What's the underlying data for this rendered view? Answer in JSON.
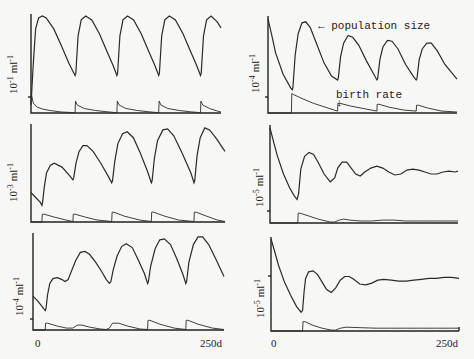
{
  "chart_data": [
    {
      "panel": "top-left",
      "type": "line",
      "ylabel": "10^-1 ml^-1",
      "ylabel_base": "10",
      "ylabel_exp": "-1",
      "ylabel_unit": "ml",
      "ylabel_unit_exp": "-1",
      "xrange": [
        0,
        250
      ],
      "series": [
        {
          "name": "population size",
          "x": [
            0,
            3,
            6,
            10,
            15,
            20,
            30,
            40,
            50,
            58,
            59,
            62,
            66,
            72,
            80,
            90,
            100,
            108,
            113,
            114,
            117,
            121,
            127,
            135,
            145,
            155,
            163,
            168,
            169,
            172,
            176,
            182,
            190,
            200,
            210,
            218,
            223,
            224,
            227,
            231,
            237,
            245,
            250
          ],
          "y": [
            0.08,
            0.5,
            0.85,
            0.96,
            0.98,
            0.96,
            0.85,
            0.68,
            0.5,
            0.38,
            0.4,
            0.78,
            0.94,
            0.98,
            0.94,
            0.8,
            0.62,
            0.48,
            0.38,
            0.4,
            0.78,
            0.94,
            0.98,
            0.94,
            0.8,
            0.62,
            0.48,
            0.38,
            0.4,
            0.78,
            0.94,
            0.98,
            0.94,
            0.8,
            0.62,
            0.48,
            0.38,
            0.4,
            0.78,
            0.94,
            0.98,
            0.92,
            0.86
          ]
        },
        {
          "name": "birth rate",
          "x": [
            0,
            1,
            3,
            8,
            15,
            25,
            40,
            58,
            58.5,
            61,
            70,
            85,
            100,
            113,
            113.5,
            116,
            125,
            140,
            155,
            168,
            168.5,
            171,
            180,
            195,
            210,
            223,
            223.5,
            226,
            235,
            245,
            250
          ],
          "y": [
            0.2,
            0.17,
            0.1,
            0.06,
            0.04,
            0.025,
            0.01,
            0.003,
            0.12,
            0.08,
            0.045,
            0.025,
            0.012,
            0.003,
            0.12,
            0.08,
            0.045,
            0.025,
            0.012,
            0.003,
            0.12,
            0.08,
            0.045,
            0.025,
            0.012,
            0.003,
            0.12,
            0.08,
            0.045,
            0.02,
            0.01
          ]
        }
      ]
    },
    {
      "panel": "middle-left",
      "type": "line",
      "ylabel": "10^-3 ml^-1",
      "ylabel_base": "10",
      "ylabel_exp": "-3",
      "ylabel_unit": "ml",
      "ylabel_unit_exp": "-1",
      "xrange": [
        0,
        250
      ],
      "series": [
        {
          "name": "population size",
          "x": [
            0,
            6,
            12,
            14,
            15,
            17,
            20,
            25,
            30,
            40,
            50,
            54,
            55,
            58,
            62,
            67,
            72,
            80,
            90,
            100,
            104,
            105,
            108,
            112,
            118,
            124,
            132,
            140,
            150,
            155,
            156,
            159,
            163,
            170,
            176,
            184,
            195,
            206,
            210,
            211,
            214,
            218,
            224,
            230,
            238,
            250
          ],
          "y": [
            0.3,
            0.25,
            0.2,
            0.17,
            0.2,
            0.35,
            0.5,
            0.58,
            0.6,
            0.56,
            0.47,
            0.43,
            0.45,
            0.6,
            0.72,
            0.78,
            0.78,
            0.72,
            0.6,
            0.46,
            0.4,
            0.42,
            0.62,
            0.8,
            0.9,
            0.92,
            0.86,
            0.72,
            0.52,
            0.4,
            0.42,
            0.65,
            0.83,
            0.94,
            0.95,
            0.88,
            0.7,
            0.5,
            0.4,
            0.42,
            0.68,
            0.86,
            0.96,
            0.94,
            0.86,
            0.72
          ]
        },
        {
          "name": "birth rate",
          "x": [
            0,
            14,
            14.5,
            17,
            30,
            45,
            54,
            54.5,
            57,
            70,
            85,
            104,
            104.5,
            107,
            120,
            140,
            155,
            155.5,
            158,
            172,
            190,
            210,
            210.5,
            213,
            226,
            240,
            250
          ],
          "y": [
            0,
            0,
            0.08,
            0.08,
            0.05,
            0.02,
            0.005,
            0.08,
            0.08,
            0.05,
            0.02,
            0.005,
            0.1,
            0.1,
            0.06,
            0.02,
            0.005,
            0.1,
            0.1,
            0.06,
            0.02,
            0.005,
            0.1,
            0.1,
            0.06,
            0.02,
            0.005
          ]
        }
      ]
    },
    {
      "panel": "bottom-left",
      "type": "line",
      "ylabel": "10^-4 ml^-1",
      "ylabel_base": "10",
      "ylabel_exp": "-4",
      "ylabel_unit": "ml",
      "ylabel_unit_exp": "-1",
      "xrange": [
        0,
        250
      ],
      "series": [
        {
          "name": "population size",
          "x": [
            0,
            6,
            12,
            16,
            17,
            19,
            22,
            26,
            32,
            38,
            42,
            46,
            50,
            56,
            62,
            68,
            74,
            82,
            90,
            96,
            100,
            102,
            105,
            110,
            116,
            122,
            130,
            138,
            146,
            150,
            151,
            154,
            160,
            166,
            172,
            180,
            188,
            196,
            200,
            201,
            204,
            210,
            216,
            222,
            230,
            240,
            250
          ],
          "y": [
            0.35,
            0.3,
            0.24,
            0.2,
            0.22,
            0.36,
            0.48,
            0.53,
            0.54,
            0.52,
            0.5,
            0.52,
            0.6,
            0.72,
            0.8,
            0.81,
            0.78,
            0.7,
            0.6,
            0.52,
            0.48,
            0.5,
            0.62,
            0.76,
            0.86,
            0.89,
            0.85,
            0.72,
            0.58,
            0.48,
            0.5,
            0.66,
            0.84,
            0.93,
            0.94,
            0.88,
            0.74,
            0.58,
            0.48,
            0.5,
            0.7,
            0.88,
            0.96,
            0.96,
            0.88,
            0.72,
            0.55
          ]
        },
        {
          "name": "birth rate",
          "x": [
            0,
            16,
            16.5,
            19,
            32,
            44,
            52,
            58,
            64,
            74,
            88,
            96,
            100,
            104,
            112,
            124,
            140,
            150,
            150.5,
            153,
            166,
            185,
            200,
            200.5,
            203,
            216,
            235,
            250
          ],
          "y": [
            0,
            0,
            0.07,
            0.07,
            0.04,
            0.02,
            0.02,
            0.05,
            0.05,
            0.03,
            0.01,
            0.005,
            0.02,
            0.07,
            0.07,
            0.04,
            0.01,
            0.005,
            0.1,
            0.1,
            0.06,
            0.02,
            0.005,
            0.1,
            0.1,
            0.06,
            0.02,
            0.005
          ]
        }
      ]
    },
    {
      "panel": "top-right",
      "type": "line",
      "ylabel": "10^-4 ml^-1",
      "ylabel_base": "10",
      "ylabel_exp": "-4",
      "ylabel_unit": "ml",
      "ylabel_unit_exp": "-1",
      "xrange": [
        0,
        250
      ],
      "series": [
        {
          "name": "population size",
          "x": [
            0,
            5,
            10,
            20,
            30,
            32,
            33,
            36,
            40,
            45,
            50,
            56,
            64,
            74,
            84,
            92,
            93,
            96,
            100,
            106,
            112,
            120,
            130,
            140,
            144,
            145,
            148,
            152,
            158,
            164,
            172,
            182,
            192,
            196,
            197,
            200,
            204,
            210,
            216,
            224,
            234,
            250
          ],
          "y": [
            0.97,
            0.8,
            0.62,
            0.4,
            0.26,
            0.24,
            0.26,
            0.6,
            0.82,
            0.93,
            0.94,
            0.88,
            0.72,
            0.52,
            0.38,
            0.34,
            0.36,
            0.58,
            0.72,
            0.8,
            0.78,
            0.7,
            0.54,
            0.4,
            0.34,
            0.35,
            0.55,
            0.68,
            0.75,
            0.74,
            0.66,
            0.5,
            0.38,
            0.34,
            0.35,
            0.55,
            0.66,
            0.72,
            0.72,
            0.64,
            0.5,
            0.35
          ]
        },
        {
          "name": "birth rate",
          "x": [
            0,
            31,
            31.5,
            34,
            45,
            60,
            80,
            92,
            92.5,
            95,
            110,
            130,
            144,
            144.5,
            147,
            160,
            180,
            196,
            196.5,
            199,
            212,
            230,
            250
          ],
          "y": [
            0,
            0,
            0.2,
            0.19,
            0.15,
            0.1,
            0.05,
            0.02,
            0.1,
            0.1,
            0.07,
            0.04,
            0.02,
            0.09,
            0.09,
            0.06,
            0.03,
            0.02,
            0.08,
            0.08,
            0.05,
            0.02,
            0.01
          ]
        }
      ]
    },
    {
      "panel": "middle-right",
      "type": "line",
      "ylabel": "10^-5 ml^-1",
      "ylabel_base": "10",
      "ylabel_exp": "-5",
      "ylabel_unit": "ml",
      "ylabel_unit_exp": "-1",
      "xrange": [
        0,
        250
      ],
      "series": [
        {
          "name": "population size",
          "x": [
            0,
            5,
            10,
            18,
            26,
            32,
            36,
            38,
            41,
            46,
            52,
            58,
            64,
            72,
            80,
            86,
            90,
            96,
            102,
            108,
            114,
            120,
            126,
            134,
            142,
            150,
            158,
            166,
            174,
            182,
            190,
            198,
            206,
            214,
            222,
            230,
            238,
            246,
            250
          ],
          "y": [
            0.97,
            0.82,
            0.68,
            0.5,
            0.36,
            0.28,
            0.24,
            0.3,
            0.55,
            0.68,
            0.72,
            0.7,
            0.62,
            0.5,
            0.42,
            0.46,
            0.56,
            0.62,
            0.62,
            0.56,
            0.5,
            0.48,
            0.52,
            0.56,
            0.58,
            0.56,
            0.52,
            0.49,
            0.5,
            0.54,
            0.55,
            0.54,
            0.52,
            0.5,
            0.5,
            0.52,
            0.53,
            0.52,
            0.53
          ]
        },
        {
          "name": "birth rate",
          "x": [
            0,
            37,
            37.5,
            40,
            52,
            64,
            80,
            86,
            92,
            98,
            106,
            120,
            135,
            150,
            165,
            180,
            200,
            220,
            240,
            250
          ],
          "y": [
            0,
            0,
            0.1,
            0.1,
            0.07,
            0.04,
            0.01,
            0.01,
            0.03,
            0.04,
            0.03,
            0.02,
            0.02,
            0.03,
            0.03,
            0.02,
            0.02,
            0.02,
            0.02,
            0.02
          ]
        }
      ]
    },
    {
      "panel": "bottom-right",
      "type": "line",
      "ylabel": "10^-5 ml^-1",
      "ylabel_base": "10",
      "ylabel_exp": "-5",
      "ylabel_unit": "ml",
      "ylabel_unit_exp": "-1",
      "xrange": [
        0,
        250
      ],
      "series": [
        {
          "name": "population size",
          "x": [
            0,
            5,
            10,
            18,
            26,
            34,
            40,
            42,
            44,
            46,
            50,
            56,
            62,
            68,
            74,
            80,
            86,
            92,
            98,
            104,
            110,
            118,
            126,
            134,
            142,
            150,
            160,
            170,
            180,
            190,
            200,
            210,
            220,
            230,
            240,
            250
          ],
          "y": [
            0.98,
            0.84,
            0.7,
            0.52,
            0.38,
            0.26,
            0.2,
            0.22,
            0.42,
            0.56,
            0.63,
            0.64,
            0.6,
            0.52,
            0.44,
            0.41,
            0.46,
            0.54,
            0.58,
            0.58,
            0.55,
            0.5,
            0.49,
            0.51,
            0.54,
            0.55,
            0.54,
            0.53,
            0.53,
            0.54,
            0.55,
            0.56,
            0.56,
            0.57,
            0.57,
            0.56
          ]
        },
        {
          "name": "birth rate",
          "x": [
            0,
            42,
            42.5,
            45,
            56,
            68,
            80,
            86,
            92,
            100,
            120,
            140,
            160,
            180,
            200,
            220,
            240,
            250
          ],
          "y": [
            0,
            0,
            0.1,
            0.1,
            0.06,
            0.03,
            0.01,
            0.01,
            0.03,
            0.04,
            0.035,
            0.03,
            0.03,
            0.03,
            0.03,
            0.03,
            0.03,
            0.03
          ]
        }
      ]
    }
  ],
  "annotations": {
    "population_size": "← population size",
    "birth_rate": "birth rate",
    "birth_rate_arrow": "↓"
  },
  "x_axis": {
    "start_label": "0",
    "end_label": "250d"
  },
  "colors": {
    "background": "#f7f7f5",
    "ink": "#222222"
  }
}
